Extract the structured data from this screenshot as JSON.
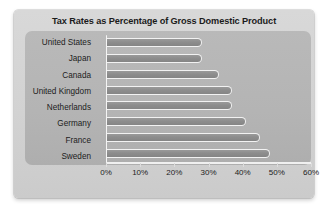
{
  "chart_data": {
    "type": "bar",
    "orientation": "horizontal",
    "title": "Tax Rates as Percentage of Gross Domestic Product",
    "xlabel": "",
    "ylabel": "",
    "categories": [
      "United States",
      "Japan",
      "Canada",
      "United Kingdom",
      "Netherlands",
      "Germany",
      "France",
      "Sweden"
    ],
    "values": [
      28,
      28,
      33,
      37,
      37,
      41,
      45,
      48
    ],
    "xlim": [
      0,
      60
    ],
    "xticks": [
      0,
      10,
      20,
      30,
      40,
      50,
      60
    ],
    "xtick_labels": [
      "0%",
      "10%",
      "20%",
      "30%",
      "40%",
      "50%",
      "60%"
    ],
    "grid": false,
    "legend": null,
    "colors": {
      "bar_fill": "#8d8d8d",
      "bar_outline": "#f2f2f2",
      "plot_background": "#b4b4b4",
      "card_background": "#d2d2d2",
      "text": "#1c1c1c",
      "axis": "#f2f2f2"
    }
  }
}
